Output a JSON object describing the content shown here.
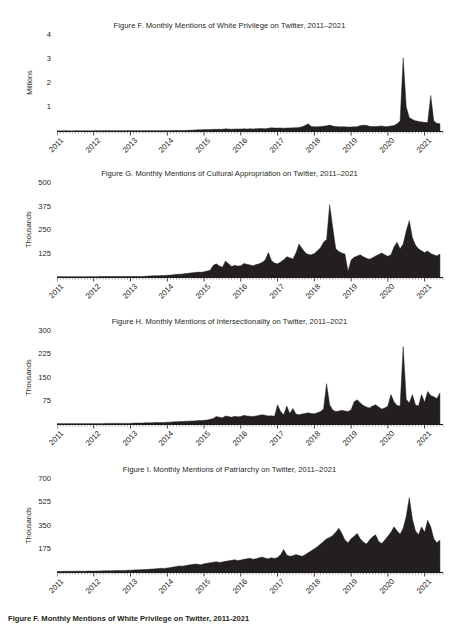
{
  "document": {
    "background_color": "#ffffff",
    "ink_color": "#231f20",
    "bottom_caption": "Figure F. Monthly Mentions of White Privilege on Twitter, 2011-2021"
  },
  "chart_data": [
    {
      "id": "figure-f",
      "type": "area",
      "title": "Figure F. Monthly Mentions of White Privilege on Twitter, 2011–2021",
      "ylabel": "Millions",
      "xlabel": "",
      "grid": false,
      "legend": "none",
      "xlim": [
        2011.0,
        2021.5
      ],
      "ylim": [
        0,
        4
      ],
      "yticks": [
        1,
        2,
        3,
        4
      ],
      "ytick_labels": [
        "1",
        "2",
        "3",
        "4"
      ],
      "xticks": [
        2011,
        2012,
        2013,
        2014,
        2015,
        2016,
        2017,
        2018,
        2019,
        2020,
        2021
      ],
      "xtick_labels": [
        "2011",
        "2012",
        "2013",
        "2014",
        "2015",
        "2016",
        "2017",
        "2018",
        "2019",
        "2020",
        "2021"
      ],
      "x": [
        2011.0,
        2011.083,
        2011.167,
        2011.25,
        2011.333,
        2011.417,
        2011.5,
        2011.583,
        2011.667,
        2011.75,
        2011.833,
        2011.917,
        2012.0,
        2012.083,
        2012.167,
        2012.25,
        2012.333,
        2012.417,
        2012.5,
        2012.583,
        2012.667,
        2012.75,
        2012.833,
        2012.917,
        2013.0,
        2013.083,
        2013.167,
        2013.25,
        2013.333,
        2013.417,
        2013.5,
        2013.583,
        2013.667,
        2013.75,
        2013.833,
        2013.917,
        2014.0,
        2014.083,
        2014.167,
        2014.25,
        2014.333,
        2014.417,
        2014.5,
        2014.583,
        2014.667,
        2014.75,
        2014.833,
        2014.917,
        2015.0,
        2015.083,
        2015.167,
        2015.25,
        2015.333,
        2015.417,
        2015.5,
        2015.583,
        2015.667,
        2015.75,
        2015.833,
        2015.917,
        2016.0,
        2016.083,
        2016.167,
        2016.25,
        2016.333,
        2016.417,
        2016.5,
        2016.583,
        2016.667,
        2016.75,
        2016.833,
        2016.917,
        2017.0,
        2017.083,
        2017.167,
        2017.25,
        2017.333,
        2017.417,
        2017.5,
        2017.583,
        2017.667,
        2017.75,
        2017.833,
        2017.917,
        2018.0,
        2018.083,
        2018.167,
        2018.25,
        2018.333,
        2018.417,
        2018.5,
        2018.583,
        2018.667,
        2018.75,
        2018.833,
        2018.917,
        2019.0,
        2019.083,
        2019.167,
        2019.25,
        2019.333,
        2019.417,
        2019.5,
        2019.583,
        2019.667,
        2019.75,
        2019.833,
        2019.917,
        2020.0,
        2020.083,
        2020.167,
        2020.25,
        2020.333,
        2020.417,
        2020.5,
        2020.583,
        2020.667,
        2020.75,
        2020.833,
        2020.917,
        2021.0,
        2021.083,
        2021.167,
        2021.25,
        2021.333,
        2021.417
      ],
      "values": [
        0.005,
        0.005,
        0.005,
        0.006,
        0.005,
        0.005,
        0.006,
        0.006,
        0.005,
        0.006,
        0.006,
        0.005,
        0.006,
        0.006,
        0.007,
        0.006,
        0.006,
        0.007,
        0.007,
        0.007,
        0.007,
        0.008,
        0.007,
        0.007,
        0.008,
        0.008,
        0.009,
        0.008,
        0.009,
        0.01,
        0.01,
        0.012,
        0.011,
        0.012,
        0.013,
        0.012,
        0.014,
        0.015,
        0.016,
        0.018,
        0.02,
        0.022,
        0.024,
        0.03,
        0.034,
        0.038,
        0.055,
        0.05,
        0.06,
        0.058,
        0.062,
        0.07,
        0.068,
        0.075,
        0.072,
        0.09,
        0.08,
        0.078,
        0.085,
        0.08,
        0.085,
        0.09,
        0.088,
        0.092,
        0.086,
        0.095,
        0.1,
        0.105,
        0.098,
        0.11,
        0.14,
        0.12,
        0.125,
        0.13,
        0.118,
        0.125,
        0.13,
        0.135,
        0.14,
        0.15,
        0.175,
        0.23,
        0.3,
        0.19,
        0.18,
        0.175,
        0.19,
        0.2,
        0.215,
        0.25,
        0.205,
        0.185,
        0.175,
        0.18,
        0.175,
        0.165,
        0.17,
        0.175,
        0.18,
        0.23,
        0.24,
        0.235,
        0.195,
        0.185,
        0.19,
        0.2,
        0.21,
        0.185,
        0.19,
        0.21,
        0.23,
        0.3,
        0.42,
        3.05,
        1.0,
        0.56,
        0.48,
        0.43,
        0.4,
        0.38,
        0.36,
        0.35,
        1.48,
        0.42,
        0.32,
        0.3
      ]
    },
    {
      "id": "figure-g",
      "type": "area",
      "title": "Figure G. Monthly Mentions of Cultural Appropriation on Twitter, 2011–2021",
      "ylabel": "Thousands",
      "xlabel": "",
      "grid": false,
      "legend": "none",
      "xlim": [
        2011.0,
        2021.5
      ],
      "ylim": [
        0,
        500
      ],
      "yticks": [
        125,
        250,
        375,
        500
      ],
      "ytick_labels": [
        "125",
        "250",
        "375",
        "500"
      ],
      "xticks": [
        2011,
        2012,
        2013,
        2014,
        2015,
        2016,
        2017,
        2018,
        2019,
        2020,
        2021
      ],
      "xtick_labels": [
        "2011",
        "2012",
        "2013",
        "2014",
        "2015",
        "2016",
        "2017",
        "2018",
        "2019",
        "2020",
        "2021"
      ],
      "x": [
        2011.0,
        2011.083,
        2011.167,
        2011.25,
        2011.333,
        2011.417,
        2011.5,
        2011.583,
        2011.667,
        2011.75,
        2011.833,
        2011.917,
        2012.0,
        2012.083,
        2012.167,
        2012.25,
        2012.333,
        2012.417,
        2012.5,
        2012.583,
        2012.667,
        2012.75,
        2012.833,
        2012.917,
        2013.0,
        2013.083,
        2013.167,
        2013.25,
        2013.333,
        2013.417,
        2013.5,
        2013.583,
        2013.667,
        2013.75,
        2013.833,
        2013.917,
        2014.0,
        2014.083,
        2014.167,
        2014.25,
        2014.333,
        2014.417,
        2014.5,
        2014.583,
        2014.667,
        2014.75,
        2014.833,
        2014.917,
        2015.0,
        2015.083,
        2015.167,
        2015.25,
        2015.333,
        2015.417,
        2015.5,
        2015.583,
        2015.667,
        2015.75,
        2015.833,
        2015.917,
        2016.0,
        2016.083,
        2016.167,
        2016.25,
        2016.333,
        2016.417,
        2016.5,
        2016.583,
        2016.667,
        2016.75,
        2016.833,
        2016.917,
        2017.0,
        2017.083,
        2017.167,
        2017.25,
        2017.333,
        2017.417,
        2017.5,
        2017.583,
        2017.667,
        2017.75,
        2017.833,
        2017.917,
        2018.0,
        2018.083,
        2018.167,
        2018.25,
        2018.333,
        2018.417,
        2018.5,
        2018.583,
        2018.667,
        2018.75,
        2018.833,
        2018.917,
        2019.0,
        2019.083,
        2019.167,
        2019.25,
        2019.333,
        2019.417,
        2019.5,
        2019.583,
        2019.667,
        2019.75,
        2019.833,
        2019.917,
        2020.0,
        2020.083,
        2020.167,
        2020.25,
        2020.333,
        2020.417,
        2020.5,
        2020.583,
        2020.667,
        2020.75,
        2020.833,
        2020.917,
        2021.0,
        2021.083,
        2021.167,
        2021.25,
        2021.333,
        2021.417
      ],
      "values": [
        1,
        1,
        1,
        1,
        1,
        1,
        1,
        1,
        1,
        1,
        1,
        1,
        1,
        1,
        2,
        2,
        2,
        2,
        2,
        2,
        2,
        2,
        2,
        2,
        2,
        2,
        3,
        3,
        3,
        4,
        5,
        6,
        7,
        7,
        8,
        8,
        9,
        10,
        12,
        14,
        15,
        16,
        18,
        20,
        22,
        24,
        26,
        25,
        28,
        32,
        36,
        62,
        70,
        58,
        52,
        85,
        70,
        56,
        62,
        58,
        60,
        72,
        68,
        64,
        60,
        66,
        70,
        78,
        92,
        130,
        88,
        74,
        70,
        80,
        92,
        108,
        102,
        96,
        128,
        175,
        152,
        130,
        120,
        118,
        125,
        140,
        155,
        185,
        200,
        385,
        265,
        150,
        135,
        128,
        122,
        30,
        90,
        105,
        112,
        118,
        108,
        100,
        95,
        102,
        112,
        120,
        128,
        118,
        110,
        118,
        160,
        185,
        150,
        175,
        245,
        300,
        210,
        170,
        150,
        140,
        130,
        138,
        125,
        118,
        112,
        122
      ]
    },
    {
      "id": "figure-h",
      "type": "area",
      "title": "Figure H. Monthly Mentions of Intersectionality on Twitter, 2011–2021",
      "ylabel": "Thousands",
      "xlabel": "",
      "grid": false,
      "legend": "none",
      "xlim": [
        2011.0,
        2021.5
      ],
      "ylim": [
        0,
        300
      ],
      "yticks": [
        75,
        150,
        225,
        300
      ],
      "ytick_labels": [
        "75",
        "150",
        "225",
        "300"
      ],
      "xticks": [
        2011,
        2012,
        2013,
        2014,
        2015,
        2016,
        2017,
        2018,
        2019,
        2020,
        2021
      ],
      "xtick_labels": [
        "2011",
        "2012",
        "2013",
        "2014",
        "2015",
        "2016",
        "2017",
        "2018",
        "2019",
        "2020",
        "2021"
      ],
      "x": [
        2011.0,
        2011.083,
        2011.167,
        2011.25,
        2011.333,
        2011.417,
        2011.5,
        2011.583,
        2011.667,
        2011.75,
        2011.833,
        2011.917,
        2012.0,
        2012.083,
        2012.167,
        2012.25,
        2012.333,
        2012.417,
        2012.5,
        2012.583,
        2012.667,
        2012.75,
        2012.833,
        2012.917,
        2013.0,
        2013.083,
        2013.167,
        2013.25,
        2013.333,
        2013.417,
        2013.5,
        2013.583,
        2013.667,
        2013.75,
        2013.833,
        2013.917,
        2014.0,
        2014.083,
        2014.167,
        2014.25,
        2014.333,
        2014.417,
        2014.5,
        2014.583,
        2014.667,
        2014.75,
        2014.833,
        2014.917,
        2015.0,
        2015.083,
        2015.167,
        2015.25,
        2015.333,
        2015.417,
        2015.5,
        2015.583,
        2015.667,
        2015.75,
        2015.833,
        2015.917,
        2016.0,
        2016.083,
        2016.167,
        2016.25,
        2016.333,
        2016.417,
        2016.5,
        2016.583,
        2016.667,
        2016.75,
        2016.833,
        2016.917,
        2017.0,
        2017.083,
        2017.167,
        2017.25,
        2017.333,
        2017.417,
        2017.5,
        2017.583,
        2017.667,
        2017.75,
        2017.833,
        2017.917,
        2018.0,
        2018.083,
        2018.167,
        2018.25,
        2018.333,
        2018.417,
        2018.5,
        2018.583,
        2018.667,
        2018.75,
        2018.833,
        2018.917,
        2019.0,
        2019.083,
        2019.167,
        2019.25,
        2019.333,
        2019.417,
        2019.5,
        2019.583,
        2019.667,
        2019.75,
        2019.833,
        2019.917,
        2020.0,
        2020.083,
        2020.167,
        2020.25,
        2020.333,
        2020.417,
        2020.5,
        2020.583,
        2020.667,
        2020.75,
        2020.833,
        2020.917,
        2021.0,
        2021.083,
        2021.167,
        2021.25,
        2021.333,
        2021.417
      ],
      "values": [
        1,
        1,
        1,
        1,
        1,
        1,
        1,
        1,
        1,
        1,
        1,
        1,
        1,
        1,
        1,
        1,
        2,
        2,
        2,
        2,
        2,
        2,
        2,
        2,
        2,
        3,
        3,
        3,
        3,
        4,
        4,
        4,
        5,
        5,
        5,
        5,
        6,
        6,
        7,
        7,
        8,
        8,
        9,
        9,
        10,
        10,
        11,
        11,
        12,
        13,
        15,
        18,
        24,
        22,
        20,
        26,
        24,
        22,
        25,
        23,
        24,
        28,
        26,
        25,
        24,
        26,
        28,
        30,
        28,
        26,
        27,
        25,
        62,
        40,
        30,
        58,
        34,
        50,
        32,
        30,
        32,
        34,
        36,
        34,
        33,
        36,
        40,
        48,
        130,
        62,
        45,
        40,
        42,
        44,
        42,
        40,
        46,
        72,
        78,
        68,
        60,
        55,
        52,
        58,
        62,
        55,
        48,
        52,
        58,
        95,
        72,
        60,
        58,
        250,
        80,
        68,
        95,
        62,
        58,
        95,
        70,
        105,
        92,
        88,
        82,
        100
      ]
    },
    {
      "id": "figure-i",
      "type": "area",
      "title": "Figure I. Monthly Mentions of Patriarchy on Twitter, 2011–2021",
      "ylabel": "Thousands",
      "xlabel": "",
      "grid": false,
      "legend": "none",
      "xlim": [
        2011.0,
        2021.5
      ],
      "ylim": [
        0,
        700
      ],
      "yticks": [
        175,
        350,
        525,
        700
      ],
      "ytick_labels": [
        "175",
        "350",
        "525",
        "700"
      ],
      "xticks": [
        2011,
        2012,
        2013,
        2014,
        2015,
        2016,
        2017,
        2018,
        2019,
        2020,
        2021
      ],
      "xtick_labels": [
        "2011",
        "2012",
        "2013",
        "2014",
        "2015",
        "2016",
        "2017",
        "2018",
        "2019",
        "2020",
        "2021"
      ],
      "x": [
        2011.0,
        2011.083,
        2011.167,
        2011.25,
        2011.333,
        2011.417,
        2011.5,
        2011.583,
        2011.667,
        2011.75,
        2011.833,
        2011.917,
        2012.0,
        2012.083,
        2012.167,
        2012.25,
        2012.333,
        2012.417,
        2012.5,
        2012.583,
        2012.667,
        2012.75,
        2012.833,
        2012.917,
        2013.0,
        2013.083,
        2013.167,
        2013.25,
        2013.333,
        2013.417,
        2013.5,
        2013.583,
        2013.667,
        2013.75,
        2013.833,
        2013.917,
        2014.0,
        2014.083,
        2014.167,
        2014.25,
        2014.333,
        2014.417,
        2014.5,
        2014.583,
        2014.667,
        2014.75,
        2014.833,
        2014.917,
        2015.0,
        2015.083,
        2015.167,
        2015.25,
        2015.333,
        2015.417,
        2015.5,
        2015.583,
        2015.667,
        2015.75,
        2015.833,
        2015.917,
        2016.0,
        2016.083,
        2016.167,
        2016.25,
        2016.333,
        2016.417,
        2016.5,
        2016.583,
        2016.667,
        2016.75,
        2016.833,
        2016.917,
        2017.0,
        2017.083,
        2017.167,
        2017.25,
        2017.333,
        2017.417,
        2017.5,
        2017.583,
        2017.667,
        2017.75,
        2017.833,
        2017.917,
        2018.0,
        2018.083,
        2018.167,
        2018.25,
        2018.333,
        2018.417,
        2018.5,
        2018.583,
        2018.667,
        2018.75,
        2018.833,
        2018.917,
        2019.0,
        2019.083,
        2019.167,
        2019.25,
        2019.333,
        2019.417,
        2019.5,
        2019.583,
        2019.667,
        2019.75,
        2019.833,
        2019.917,
        2020.0,
        2020.083,
        2020.167,
        2020.25,
        2020.333,
        2020.417,
        2020.5,
        2020.583,
        2020.667,
        2020.75,
        2020.833,
        2020.917,
        2021.0,
        2021.083,
        2021.167,
        2021.25,
        2021.333,
        2021.417
      ],
      "values": [
        4,
        4,
        5,
        5,
        5,
        5,
        6,
        6,
        6,
        6,
        7,
        7,
        7,
        8,
        8,
        9,
        9,
        10,
        10,
        11,
        11,
        12,
        12,
        13,
        14,
        15,
        16,
        17,
        18,
        19,
        20,
        22,
        24,
        26,
        28,
        27,
        30,
        34,
        38,
        42,
        46,
        44,
        48,
        52,
        56,
        60,
        58,
        55,
        62,
        66,
        70,
        74,
        78,
        72,
        76,
        80,
        84,
        88,
        92,
        86,
        90,
        96,
        100,
        104,
        96,
        100,
        108,
        112,
        104,
        100,
        108,
        102,
        110,
        130,
        170,
        128,
        118,
        122,
        132,
        125,
        118,
        130,
        145,
        160,
        175,
        190,
        210,
        230,
        250,
        260,
        275,
        300,
        330,
        290,
        240,
        220,
        250,
        270,
        290,
        250,
        225,
        210,
        240,
        265,
        280,
        230,
        215,
        240,
        270,
        300,
        340,
        310,
        285,
        330,
        420,
        560,
        400,
        310,
        280,
        340,
        300,
        390,
        340,
        250,
        220,
        240
      ]
    }
  ]
}
